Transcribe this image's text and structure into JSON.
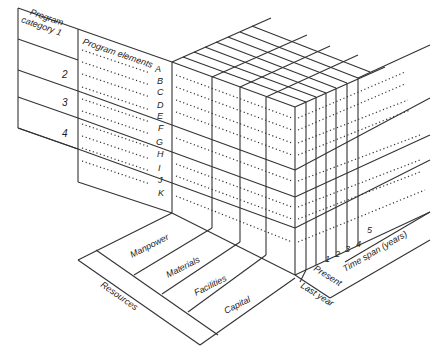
{
  "diagram": {
    "program_panel": {
      "header_category": [
        "Program",
        "category 1"
      ],
      "header_elements": "Program elements",
      "categories": [
        "2",
        "3",
        "4"
      ],
      "elements": [
        "A",
        "B",
        "C",
        "D",
        "E",
        "F",
        "G",
        "H",
        "I",
        "J",
        "K"
      ]
    },
    "resources_panel": {
      "axis_label": "Resources",
      "items": [
        "Manpower",
        "Materials",
        "Facilities",
        "Capital"
      ]
    },
    "time_panel": {
      "axis_label": "Time span (years)",
      "labels": [
        "Last year",
        "Present",
        "1",
        "2",
        "3",
        "4",
        "5"
      ]
    },
    "colors": {
      "line": "#333333",
      "background": "#ffffff"
    }
  }
}
